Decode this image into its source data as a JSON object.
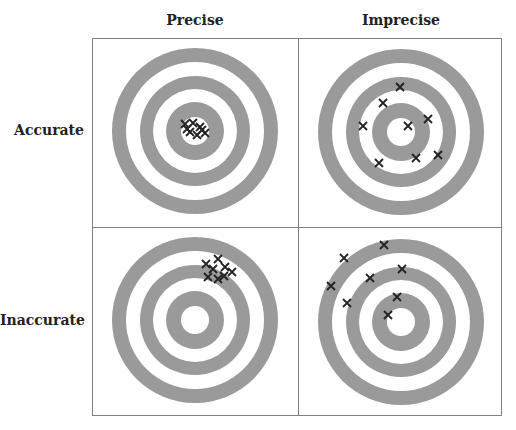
{
  "columns": [
    {
      "label": "Precise"
    },
    {
      "label": "Imprecise"
    }
  ],
  "rows": [
    {
      "label": "Accurate"
    },
    {
      "label": "Inaccurate"
    }
  ],
  "colors": {
    "ring": "#9a9a9a",
    "background": "#ffffff",
    "border": "#808080",
    "mark": "#222222"
  },
  "ring_radii": [
    83,
    69,
    55,
    42,
    29,
    14
  ],
  "panels": [
    {
      "name": "accurate-precise",
      "center": [
        195,
        131
      ],
      "hits": [
        [
          185,
          124
        ],
        [
          193,
          123
        ],
        [
          200,
          127
        ],
        [
          190,
          132
        ],
        [
          197,
          135
        ],
        [
          205,
          133
        ],
        [
          187,
          129
        ],
        [
          202,
          130
        ]
      ]
    },
    {
      "name": "accurate-imprecise",
      "center": [
        401,
        132
      ],
      "hits": [
        [
          400,
          87
        ],
        [
          383,
          103
        ],
        [
          363,
          126
        ],
        [
          408,
          126
        ],
        [
          428,
          119
        ],
        [
          379,
          163
        ],
        [
          416,
          158
        ],
        [
          438,
          155
        ]
      ]
    },
    {
      "name": "inaccurate-precise",
      "center": [
        195,
        320
      ],
      "hits": [
        [
          206,
          264
        ],
        [
          218,
          259
        ],
        [
          213,
          269
        ],
        [
          225,
          267
        ],
        [
          232,
          272
        ],
        [
          208,
          277
        ],
        [
          218,
          279
        ],
        [
          224,
          276
        ]
      ]
    },
    {
      "name": "inaccurate-imprecise",
      "center": [
        401,
        322
      ],
      "hits": [
        [
          344,
          258
        ],
        [
          384,
          245
        ],
        [
          331,
          286
        ],
        [
          370,
          278
        ],
        [
          402,
          269
        ],
        [
          347,
          303
        ],
        [
          397,
          297
        ],
        [
          388,
          315
        ]
      ]
    }
  ]
}
